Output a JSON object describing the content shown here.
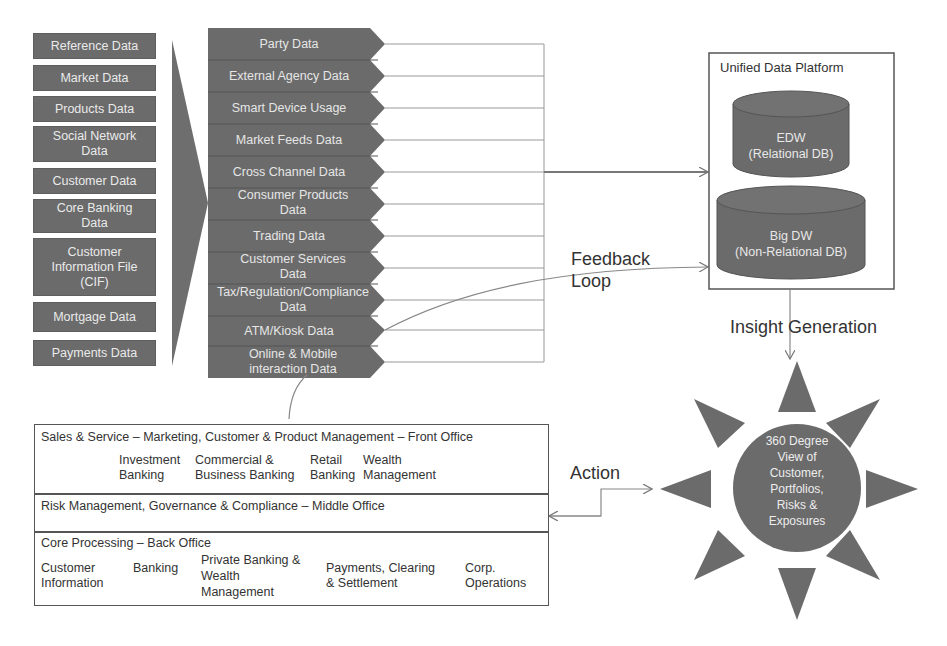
{
  "sources": {
    "items": [
      {
        "label": "Reference Data"
      },
      {
        "label": "Market Data"
      },
      {
        "label": "Products Data"
      },
      {
        "label": "Social Network Data"
      },
      {
        "label": "Customer Data"
      },
      {
        "label": "Core Banking Data"
      },
      {
        "label": "Customer Information File (CIF)"
      },
      {
        "label": "Mortgage Data"
      },
      {
        "label": "Payments Data"
      }
    ]
  },
  "channels": {
    "items": [
      {
        "label": "Party Data"
      },
      {
        "label": "External Agency Data"
      },
      {
        "label": "Smart Device Usage"
      },
      {
        "label": "Market Feeds Data"
      },
      {
        "label": "Cross Channel Data"
      },
      {
        "label": "Consumer Products Data"
      },
      {
        "label": "Trading Data"
      },
      {
        "label": "Customer Services Data"
      },
      {
        "label": "Tax/Regulation/Compliance Data"
      },
      {
        "label": "ATM/Kiosk Data"
      },
      {
        "label": "Online & Mobile interaction Data"
      }
    ]
  },
  "platform": {
    "title": "Unified Data Platform",
    "edw": {
      "line1": "EDW",
      "line2": "(Relational DB)"
    },
    "bigdw": {
      "line1": "Big DW",
      "line2": "(Non-Relational DB)"
    }
  },
  "labels": {
    "feedback_line1": "Feedback",
    "feedback_line2": "Loop",
    "insight": "Insight Generation",
    "action": "Action"
  },
  "hub": {
    "line1": "360 Degree",
    "line2": "View of",
    "line3": "Customer,",
    "line4": "Portfolios,",
    "line5": "Risks &",
    "line6": "Exposures"
  },
  "offices": {
    "front": {
      "title": "Sales & Service – Marketing, Customer & Product Management – Front Office",
      "units": [
        {
          "line1": "Investment",
          "line2": "Banking"
        },
        {
          "line1": "Commercial &",
          "line2": "Business Banking"
        },
        {
          "line1": "Retail",
          "line2": "Banking"
        },
        {
          "line1": "Wealth",
          "line2": "Management"
        }
      ]
    },
    "middle": {
      "title": "Risk Management, Governance & Compliance – Middle Office"
    },
    "back": {
      "title": "Core Processing – Back Office",
      "units": [
        {
          "line1": "Customer",
          "line2": "Information",
          "line3": ""
        },
        {
          "line1": "Banking",
          "line2": "",
          "line3": ""
        },
        {
          "line1": "Private Banking &",
          "line2": "Wealth",
          "line3": "Management"
        },
        {
          "line1": "Payments, Clearing",
          "line2": "& Settlement",
          "line3": ""
        },
        {
          "line1": "Corp.",
          "line2": "Operations",
          "line3": ""
        }
      ]
    }
  },
  "colors": {
    "box_fill": "#6b6b6b",
    "line": "#8a8a8a",
    "text": "#333333"
  }
}
